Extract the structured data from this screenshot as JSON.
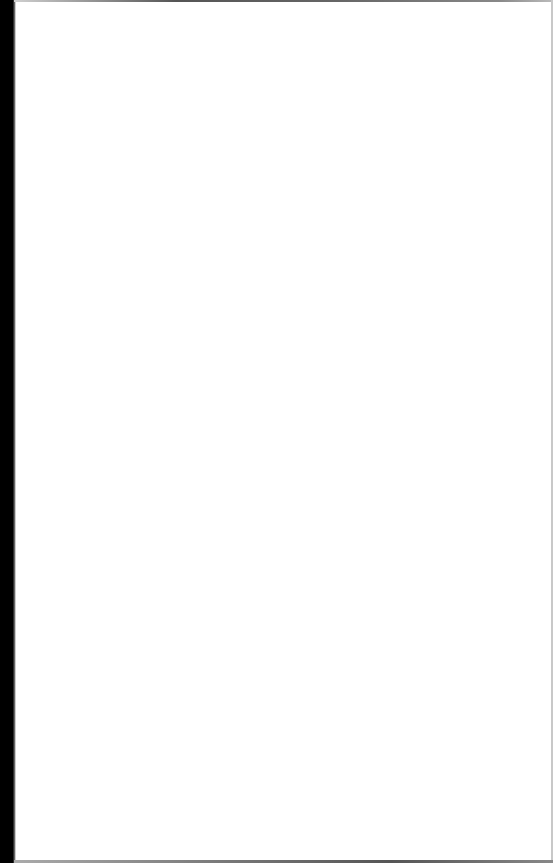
{
  "document": {
    "type": "scanned-page",
    "content": "",
    "is_blank": true
  },
  "colors": {
    "page_background": "#ffffff",
    "binding_edge": "#000000",
    "scan_border": "#666666"
  }
}
